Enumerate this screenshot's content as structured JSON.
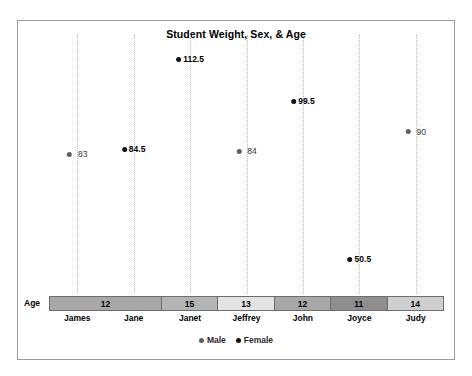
{
  "chart_data": {
    "type": "scatter",
    "title": "Student Weight, Sex, & Age",
    "xlabel": "",
    "ylabel": "",
    "axis_row_label": "Age",
    "ylim": [
      40,
      120
    ],
    "grid": "vertical-dotted-droplines",
    "legend_position": "bottom-center",
    "categories": [
      "James",
      "Jane",
      "Janet",
      "Jeffrey",
      "John",
      "Joyce",
      "Judy"
    ],
    "values": [
      83,
      84.5,
      112.5,
      84,
      99.5,
      50.5,
      90
    ],
    "value_labels": [
      "83",
      "84.5",
      "112.5",
      "84",
      "99.5",
      "50.5",
      "90"
    ],
    "sex": [
      "Male",
      "Female",
      "Female",
      "Male",
      "Female",
      "Female",
      "Male"
    ],
    "ages": [
      12,
      12,
      15,
      13,
      12,
      11,
      14
    ],
    "legend": [
      {
        "label": "Male",
        "color": "#5f5f5f"
      },
      {
        "label": "Female",
        "color": "#111111"
      }
    ],
    "age_groups": [
      {
        "age": "12",
        "span": 2,
        "fill": "#a8a8a8"
      },
      {
        "age": "15",
        "span": 1,
        "fill": "#b4b4b4"
      },
      {
        "age": "13",
        "span": 1,
        "fill": "#e3e3e3"
      },
      {
        "age": "12",
        "span": 1,
        "fill": "#a8a8a8"
      },
      {
        "age": "11",
        "span": 1,
        "fill": "#8e8e8e"
      },
      {
        "age": "14",
        "span": 1,
        "fill": "#cfcfcf"
      }
    ]
  }
}
